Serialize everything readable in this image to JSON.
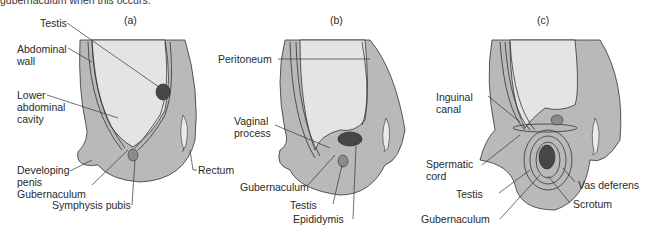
{
  "caption_fragment": "gubernaculum when this occurs.",
  "panels": [
    {
      "id": "a",
      "title": "(a)",
      "labels": [
        "Testis",
        "Abdominal",
        "wall",
        "Lower",
        "abdominal",
        "cavity",
        "Developing",
        "penis",
        "Gubernaculum",
        "Symphysis pubis",
        "Rectum"
      ]
    },
    {
      "id": "b",
      "title": "(b)",
      "labels": [
        "Peritoneum",
        "Vaginal",
        "process",
        "Gubernaculum",
        "Testis",
        "Epididymis"
      ]
    },
    {
      "id": "c",
      "title": "(c)",
      "labels": [
        "Inguinal",
        "canal",
        "Spermatic",
        "cord",
        "Testis",
        "Gubernaculum",
        "Vas deferens",
        "Scrotum"
      ]
    }
  ],
  "colors": {
    "tissue": "#b8b8b8",
    "cavity": "#e4e4e4",
    "testis": "#4a4a4a",
    "outline": "#333333"
  }
}
